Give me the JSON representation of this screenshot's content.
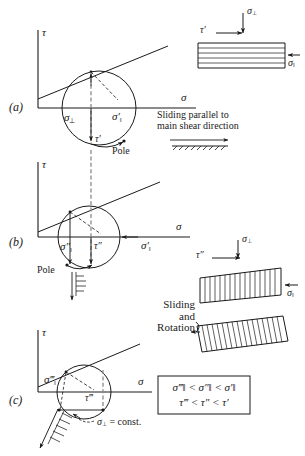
{
  "figure": {
    "axes": {
      "tau": "τ",
      "sigma": "σ"
    },
    "panels": [
      {
        "id": "(a)",
        "labels": {
          "sigma_perp": "σ",
          "sigma_perp_sub": "⊥",
          "sigma_par": "σ′",
          "sigma_par_sub": "‖",
          "tau": "τ′",
          "pole": "Pole"
        },
        "annotation_line1": "Sliding parallel to",
        "annotation_line2": "main shear direction"
      },
      {
        "id": "(b)",
        "labels": {
          "sigma_par2": "σ″",
          "sigma_par2_sub": "‖",
          "tau": "τ″",
          "sigma_par_ref": "σ′",
          "sigma_par_ref_sub": "‖",
          "pole": "Pole"
        }
      },
      {
        "id": "(c)",
        "labels": {
          "sigma_par3": "σ‴",
          "sigma_par3_sub": "‖",
          "tau": "τ‴",
          "sigma_const": "σ",
          "sigma_const_sub": "⊥",
          "sigma_const_eq": "= const."
        }
      }
    ],
    "blocks": [
      {
        "name": "block-top",
        "sigma_perp": "σ",
        "sigma_perp_sub": "⊥",
        "tau": "τ′",
        "sigma_par": "σ",
        "sigma_par_sub": "‖"
      },
      {
        "name": "block-middle",
        "sigma_perp": "σ",
        "sigma_perp_sub": "⊥",
        "tau": "τ″",
        "sigma_par": "σ",
        "sigma_par_sub": "‖"
      },
      {
        "name": "block-bottom",
        "caption_line1": "Sliding",
        "caption_line2": "and",
        "caption_line3": "Rotation"
      }
    ],
    "inequality_box": {
      "line1_parts": [
        "σ‴",
        "‖",
        "<",
        "σ″",
        "‖",
        "<",
        "σ′",
        "‖"
      ],
      "line1_text": "σ‴‖ < σ″‖ < σ′‖",
      "line2_text": "τ‴ < τ″ < τ′"
    },
    "colors": {
      "ink": "#1a1a1a",
      "background": "#ffffff"
    }
  }
}
